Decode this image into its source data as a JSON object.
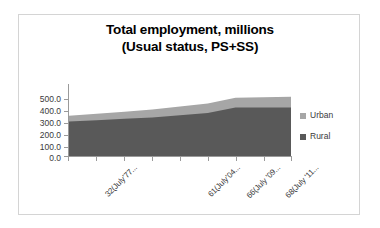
{
  "chart_data": {
    "type": "area",
    "stacked": true,
    "title": "Total employment, millions",
    "subtitle": "(Usual status, PS+SS)",
    "title_lines": [
      "Total employment, millions",
      "(Usual status, PS+SS)"
    ],
    "xlabel": "",
    "ylabel": "",
    "ylim": [
      0.0,
      500.0
    ],
    "ytick_step": 100.0,
    "ytick_labels": [
      "500.0",
      "400.0",
      "300.0",
      "200.0",
      "100.0",
      "0.0"
    ],
    "ytick_values": [
      500.0,
      400.0,
      300.0,
      200.0,
      100.0,
      0.0
    ],
    "grid": false,
    "legend_position": "right",
    "categories": [
      "32(July'77...",
      "",
      "",
      "61(July'04...",
      "",
      "66(July '09...",
      "",
      "68(July '11...",
      ""
    ],
    "xtick_labels_visible": [
      "32(July'77...",
      "61(July'04...",
      "66(July '09...",
      "68(July '11..."
    ],
    "x": [
      0,
      1,
      2,
      3,
      4,
      5,
      6,
      7,
      8
    ],
    "series": [
      {
        "name": "Rural",
        "color": "#595959",
        "values": [
          239,
          248,
          258,
          268,
          283,
          298,
          336,
          336,
          336
        ]
      },
      {
        "name": "Urban",
        "color": "#a6a6a6",
        "values": [
          41,
          45,
          50,
          55,
          60,
          66,
          68,
          72,
          76
        ]
      }
    ],
    "totals": [
      280,
      293,
      308,
      323,
      343,
      364,
      404,
      408,
      412
    ]
  },
  "legend": {
    "items": [
      {
        "label": "Urban",
        "color": "#a6a6a6"
      },
      {
        "label": "Rural",
        "color": "#595959"
      }
    ]
  },
  "colors": {
    "urban": "#a6a6a6",
    "rural": "#595959",
    "axis": "#9a9a9a",
    "text": "#3a3a3a",
    "border": "#d4d4d4",
    "background": "#ffffff"
  }
}
